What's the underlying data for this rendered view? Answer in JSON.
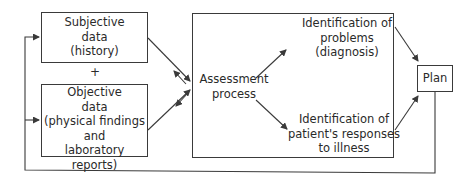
{
  "diagram": {
    "subjective_box": {
      "line1": "Subjective",
      "line2": "data",
      "line3": "(history)"
    },
    "plus_sign": "+",
    "objective_box": {
      "line1": "Objective",
      "line2": "data",
      "line3": "(physical findings",
      "line4": "and",
      "line5": "laboratory reports)"
    },
    "assessment": {
      "line1": "Assessment",
      "line2": "process"
    },
    "problems": {
      "line1": "Identification of",
      "line2": "problems",
      "line3": "(diagnosis)"
    },
    "responses": {
      "line1": "Identification of",
      "line2": "patient's responses",
      "line3": "to illness"
    },
    "plan_box": {
      "label": "Plan"
    },
    "colors": {
      "stroke": "#3a3a3a",
      "text": "#2a2a2a",
      "background": "#ffffff"
    }
  }
}
